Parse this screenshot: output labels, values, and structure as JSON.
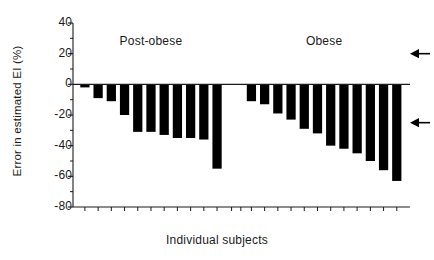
{
  "chart_data": {
    "type": "bar",
    "title": "",
    "xlabel": "Individual subjects",
    "ylabel": "Error in estimated EI (%)",
    "ylim": [
      -80,
      40
    ],
    "ytick_values": [
      40,
      20,
      0,
      -20,
      -40,
      -60,
      -80
    ],
    "ytick_labels": [
      "40",
      "20",
      "0",
      "-20",
      "-40",
      "-60",
      "-80"
    ],
    "yminor_step": 10,
    "grid": false,
    "legend": "none",
    "xtick_labels": [],
    "groups": [
      {
        "name": "Post-obese",
        "label": "Post-obese",
        "values": [
          -2,
          -9,
          -11,
          -20,
          -31,
          -31,
          -33,
          -35,
          -35,
          -36,
          -55
        ]
      },
      {
        "name": "Obese",
        "label": "Obese",
        "values": [
          -11,
          -13,
          -19,
          -23,
          -29,
          -32,
          -40,
          -42,
          -45,
          -50,
          -56,
          -63
        ]
      }
    ],
    "annotations": [
      {
        "name": "upper-reference-arrow",
        "symbol": "left-arrow",
        "y_value": 20
      },
      {
        "name": "lower-reference-arrow",
        "symbol": "left-arrow",
        "y_value": -25
      }
    ]
  },
  "colors": {
    "bar": "#000000",
    "axis": "#1a1a1a",
    "background": "#ffffff",
    "text": "#1a1a1a"
  }
}
